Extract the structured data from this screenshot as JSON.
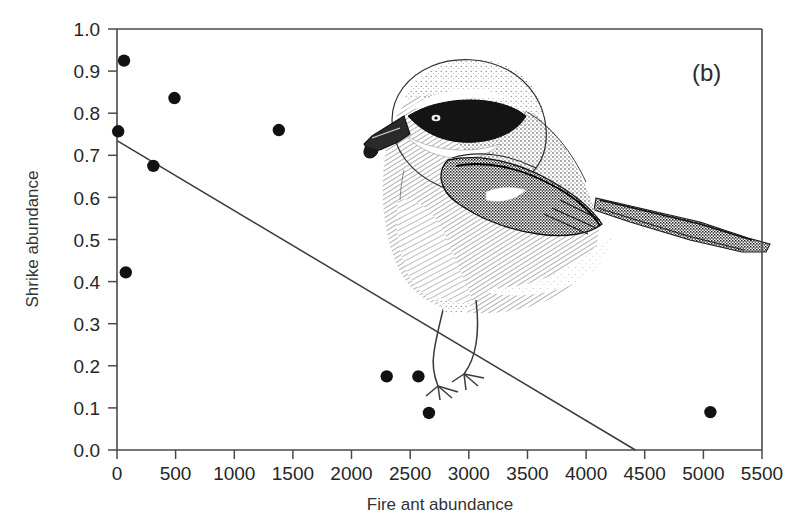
{
  "figure": {
    "panel_label": "(b)",
    "background_color": "#ffffff",
    "point_color": "#121212",
    "line_color": "#3a3a3a",
    "axis_color": "#4a4a4a"
  },
  "illustration": {
    "name": "loggerhead-shrike-drawing",
    "description": "Stippled black-and-white drawing of a loggerhead shrike perched, facing left, with black eye mask, hooked bill, dark wings with white patch and long dark tail extending past the right axis"
  },
  "chart_data": {
    "type": "scatter",
    "title": "",
    "panel": "(b)",
    "xlabel": "Fire ant abundance",
    "ylabel": "Shrike abundance",
    "xlim": [
      0,
      5500
    ],
    "ylim": [
      0.0,
      1.0
    ],
    "xticks": [
      0,
      500,
      1000,
      1500,
      2000,
      2500,
      3000,
      3500,
      4000,
      4500,
      5000,
      5500
    ],
    "xtick_labels": [
      "0",
      "500",
      "1000",
      "1500",
      "2000",
      "2500",
      "3000",
      "3500",
      "4000",
      "4500",
      "5000",
      "5500"
    ],
    "yticks": [
      0.0,
      0.1,
      0.2,
      0.3,
      0.4,
      0.5,
      0.6,
      0.7,
      0.8,
      0.9,
      1.0
    ],
    "ytick_labels": [
      "0.0",
      "0.1",
      "0.2",
      "0.3",
      "0.4",
      "0.5",
      "0.6",
      "0.7",
      "0.8",
      "0.9",
      "1.0"
    ],
    "grid": false,
    "legend": "none",
    "series": [
      {
        "name": "Shrike abundance vs fire ant abundance",
        "marker": "filled-circle",
        "points": [
          {
            "x": 10,
            "y": 0.757
          },
          {
            "x": 60,
            "y": 0.925
          },
          {
            "x": 75,
            "y": 0.422
          },
          {
            "x": 310,
            "y": 0.675
          },
          {
            "x": 490,
            "y": 0.836
          },
          {
            "x": 1380,
            "y": 0.76
          },
          {
            "x": 2300,
            "y": 0.175
          },
          {
            "x": 2570,
            "y": 0.175
          },
          {
            "x": 2660,
            "y": 0.088
          },
          {
            "x": 5060,
            "y": 0.09
          }
        ]
      }
    ],
    "trend_line": {
      "name": "regression-line",
      "x_start": 0,
      "y_start": 0.735,
      "x_end": 4420,
      "y_end": 0.0
    }
  }
}
